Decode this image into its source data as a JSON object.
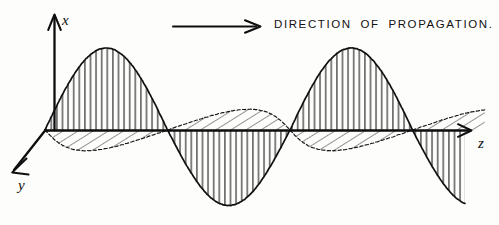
{
  "figure": {
    "style": "hand-drawn line illustration, black ink on off-white paper",
    "caption": {
      "text": "DIRECTION  OF  PROPAGATION.",
      "arrow_icon": "right-arrow-icon"
    },
    "axes": [
      {
        "id": "x",
        "label": "x",
        "direction": "up",
        "arrow": true,
        "origin": [
          45,
          130
        ],
        "tip": [
          55,
          14
        ],
        "label_pos": [
          64,
          24
        ]
      },
      {
        "id": "y",
        "label": "y",
        "direction": "down-left",
        "arrow": true,
        "origin": [
          45,
          130
        ],
        "tip": [
          12,
          172
        ],
        "label_pos": [
          21,
          186
        ]
      },
      {
        "id": "z",
        "label": "z",
        "direction": "right",
        "arrow": true,
        "origin": [
          45,
          130
        ],
        "tip": [
          476,
          130
        ],
        "label_pos": [
          479,
          146
        ]
      }
    ],
    "waves": [
      {
        "id": "x-component",
        "name": "electric-field-wave",
        "plane": "x-z",
        "hatch": "vertical",
        "amplitude": 82,
        "wavelength": 245,
        "phase_deg": 0,
        "z_start": 45,
        "z_end": 465,
        "stroke": "#111111"
      },
      {
        "id": "y-component",
        "name": "magnetic-field-wave",
        "plane": "y-z",
        "hatch": "diagonal",
        "amplitude": 44,
        "wavelength": 245,
        "phase_deg": 0,
        "z_start": 45,
        "z_end": 465,
        "skew_x": -0.46,
        "skew_y": 0.47,
        "stroke": "#111111"
      }
    ],
    "colors": {
      "ink": "#111111",
      "paper": "#fdfdfc",
      "hatch": "#1a1a1a"
    },
    "zero_crossings_z": [
      45,
      190,
      315,
      437
    ],
    "peaks": [
      {
        "type": "crest",
        "z": 128,
        "value": 82
      },
      {
        "type": "trough",
        "z": 252,
        "value": -75
      },
      {
        "type": "crest",
        "z": 375,
        "value": 82
      }
    ]
  }
}
